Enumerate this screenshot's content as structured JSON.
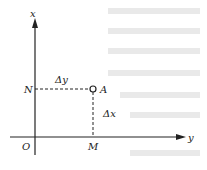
{
  "diagram": {
    "axes": {
      "vertical_label": "x",
      "horizontal_label": "y",
      "origin_label": "O"
    },
    "point": {
      "label": "A"
    },
    "projections": {
      "on_vertical_axis": "N",
      "on_horizontal_axis": "M"
    },
    "segments": {
      "horizontal_dashed": "Δy",
      "vertical_dashed": "Δx"
    }
  }
}
